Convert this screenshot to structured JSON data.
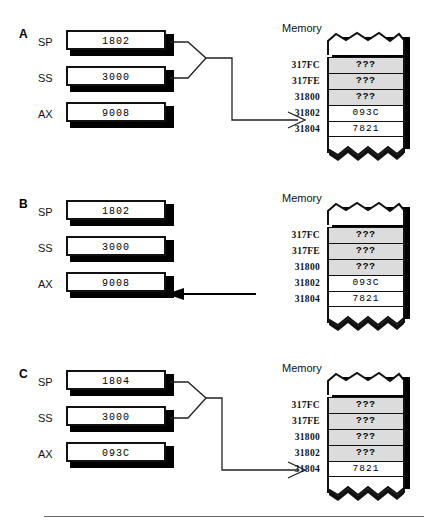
{
  "figure": {
    "memory_title": "Memory",
    "addresses": [
      "317FC",
      "317FE",
      "31800",
      "31802",
      "31804"
    ],
    "register_names": [
      "SP",
      "SS",
      "AX"
    ],
    "unknown_token": "???"
  },
  "panels": [
    {
      "letter": "A",
      "registers": [
        {
          "name": "SP",
          "value": "1802"
        },
        {
          "name": "SS",
          "value": "3000"
        },
        {
          "name": "AX",
          "value": "9008"
        }
      ],
      "memory_title": "Memory",
      "memory_cells": [
        {
          "address": "317FC",
          "value": "???",
          "shaded": true
        },
        {
          "address": "317FE",
          "value": "???",
          "shaded": true
        },
        {
          "address": "31800",
          "value": "???",
          "shaded": true
        },
        {
          "address": "31802",
          "value": "093C",
          "shaded": false
        },
        {
          "address": "31804",
          "value": "7821",
          "shaded": false
        }
      ],
      "arrow": {
        "direction": "register-to-memory",
        "target_address": "31802",
        "style": "y-merge"
      }
    },
    {
      "letter": "B",
      "registers": [
        {
          "name": "SP",
          "value": "1802"
        },
        {
          "name": "SS",
          "value": "3000"
        },
        {
          "name": "AX",
          "value": "9008"
        }
      ],
      "memory_title": "Memory",
      "memory_cells": [
        {
          "address": "317FC",
          "value": "???",
          "shaded": true
        },
        {
          "address": "317FE",
          "value": "???",
          "shaded": true
        },
        {
          "address": "31800",
          "value": "???",
          "shaded": true
        },
        {
          "address": "31802",
          "value": "093C",
          "shaded": false
        },
        {
          "address": "31804",
          "value": "7821",
          "shaded": false
        }
      ],
      "arrow": {
        "direction": "memory-to-register",
        "source_address": "31802",
        "target_register": "AX",
        "style": "straight"
      }
    },
    {
      "letter": "C",
      "registers": [
        {
          "name": "SP",
          "value": "1804"
        },
        {
          "name": "SS",
          "value": "3000"
        },
        {
          "name": "AX",
          "value": "093C"
        }
      ],
      "memory_title": "Memory",
      "memory_cells": [
        {
          "address": "317FC",
          "value": "???",
          "shaded": true
        },
        {
          "address": "317FE",
          "value": "???",
          "shaded": true
        },
        {
          "address": "31800",
          "value": "???",
          "shaded": true
        },
        {
          "address": "31802",
          "value": "???",
          "shaded": true
        },
        {
          "address": "31804",
          "value": "7821",
          "shaded": false
        }
      ],
      "arrow": {
        "direction": "register-to-memory",
        "target_address": "31804",
        "style": "y-merge"
      }
    }
  ],
  "colors": {
    "ink": "#111111",
    "paper": "#ffffff",
    "shaded_cell": "#dcdcdc",
    "rule": "#6a6a6a"
  }
}
